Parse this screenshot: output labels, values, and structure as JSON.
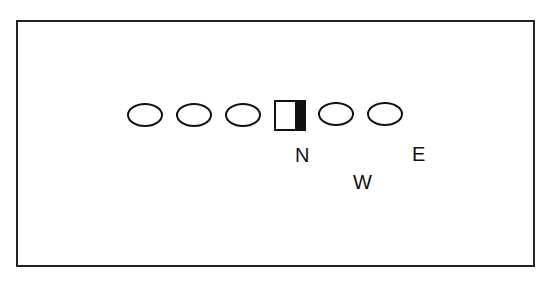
{
  "diagram": {
    "type": "football-formation",
    "players": [
      {
        "shape": "oval",
        "label": ""
      },
      {
        "shape": "oval",
        "label": ""
      },
      {
        "shape": "oval",
        "label": ""
      },
      {
        "shape": "center-square",
        "label": ""
      },
      {
        "shape": "oval",
        "label": ""
      },
      {
        "shape": "oval",
        "label": ""
      }
    ],
    "labels": {
      "n": "N",
      "w": "W",
      "e": "E"
    }
  }
}
